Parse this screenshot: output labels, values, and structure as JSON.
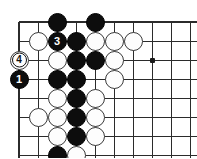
{
  "diagram": {
    "board": {
      "grid_spacing_px": 19,
      "origin_x_px": 19,
      "origin_y_px": 22,
      "columns_visible": 9,
      "rows_visible": 7,
      "edges": [
        "top",
        "left"
      ],
      "star_points": [
        {
          "col": 3,
          "row": 2
        },
        {
          "col": 7,
          "row": 2
        }
      ]
    },
    "stones": [
      {
        "col": 1,
        "row": -1,
        "color": "black",
        "label": ""
      },
      {
        "col": 3,
        "row": -1,
        "color": "black",
        "label": ""
      },
      {
        "col": 0,
        "row": 0,
        "color": "white",
        "label": ""
      },
      {
        "col": 1,
        "row": 0,
        "color": "black",
        "label": "3"
      },
      {
        "col": 2,
        "row": 0,
        "color": "black",
        "label": ""
      },
      {
        "col": 3,
        "row": 0,
        "color": "white",
        "label": ""
      },
      {
        "col": 4,
        "row": 0,
        "color": "white",
        "label": ""
      },
      {
        "col": 5,
        "row": 0,
        "color": "white",
        "label": ""
      },
      {
        "col": -1,
        "row": 1,
        "color": "white",
        "label": "4"
      },
      {
        "col": 1,
        "row": 1,
        "color": "white",
        "label": ""
      },
      {
        "col": 2,
        "row": 1,
        "color": "black",
        "label": ""
      },
      {
        "col": 3,
        "row": 1,
        "color": "black",
        "label": ""
      },
      {
        "col": 4,
        "row": 1,
        "color": "white",
        "label": ""
      },
      {
        "col": -1,
        "row": 2,
        "color": "black",
        "label": "1"
      },
      {
        "col": 1,
        "row": 2,
        "color": "black",
        "label": ""
      },
      {
        "col": 2,
        "row": 2,
        "color": "black",
        "label": ""
      },
      {
        "col": 4,
        "row": 2,
        "color": "white",
        "label": ""
      },
      {
        "col": 1,
        "row": 3,
        "color": "white",
        "label": ""
      },
      {
        "col": 2,
        "row": 3,
        "color": "black",
        "label": ""
      },
      {
        "col": 3,
        "row": 3,
        "color": "white",
        "label": ""
      },
      {
        "col": 0,
        "row": 4,
        "color": "white",
        "label": ""
      },
      {
        "col": 1,
        "row": 4,
        "color": "white",
        "label": ""
      },
      {
        "col": 2,
        "row": 4,
        "color": "black",
        "label": ""
      },
      {
        "col": 3,
        "row": 4,
        "color": "white",
        "label": ""
      },
      {
        "col": 1,
        "row": 5,
        "color": "white",
        "label": ""
      },
      {
        "col": 2,
        "row": 5,
        "color": "black",
        "label": ""
      },
      {
        "col": 3,
        "row": 5,
        "color": "white",
        "label": ""
      },
      {
        "col": 1,
        "row": 6,
        "color": "black",
        "label": ""
      },
      {
        "col": 2,
        "row": 6,
        "color": "white",
        "label": ""
      },
      {
        "col": 1,
        "row": 7,
        "color": "white",
        "label": "2"
      },
      {
        "col": 2,
        "row": 7,
        "color": "white",
        "label": ""
      }
    ],
    "move_numbers": {
      "1": {
        "color": "black",
        "text": "1"
      },
      "2": {
        "color": "white",
        "text": "2"
      },
      "3": {
        "color": "black",
        "text": "3"
      },
      "4": {
        "color": "white",
        "text": "4"
      }
    },
    "colors": {
      "line": "#2b2b2b",
      "black_stone": "#0d0d0d",
      "white_stone": "#fdfdfd",
      "white_stone_border": "#3a3a3a",
      "background": "#ffffff",
      "star_point": "#1a1a1a"
    }
  }
}
